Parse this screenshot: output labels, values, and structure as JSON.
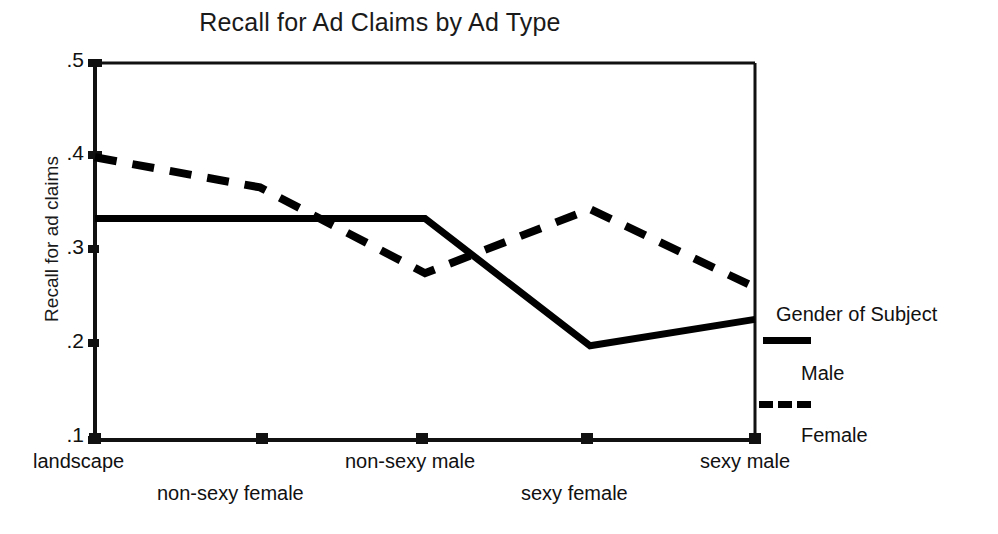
{
  "chart_data": {
    "type": "line",
    "title": "Recall for Ad Claims by Ad Type",
    "xlabel": "",
    "ylabel": "Recall for ad claims",
    "categories": [
      "landscape",
      "non-sexy female",
      "non-sexy male",
      "sexy female",
      "sexy male"
    ],
    "ylim": [
      0.1,
      0.5
    ],
    "yticks": [
      0.1,
      0.2,
      0.3,
      0.4,
      0.5
    ],
    "ytick_labels": [
      ".1",
      ".2",
      ".3",
      ".4",
      ".5"
    ],
    "grid": false,
    "legend_position": "right",
    "series": [
      {
        "name": "Male",
        "style": "solid",
        "color": "#000000",
        "values": [
          0.335,
          0.335,
          0.335,
          0.2,
          0.228
        ]
      },
      {
        "name": "Female",
        "style": "dashed",
        "color": "#000000",
        "values": [
          0.4,
          0.368,
          0.277,
          0.345,
          0.262
        ]
      }
    ],
    "legend": {
      "title": "Gender of Subject",
      "entries": [
        {
          "label": "Male",
          "style": "solid"
        },
        {
          "label": "Female",
          "style": "dashed"
        }
      ]
    }
  }
}
